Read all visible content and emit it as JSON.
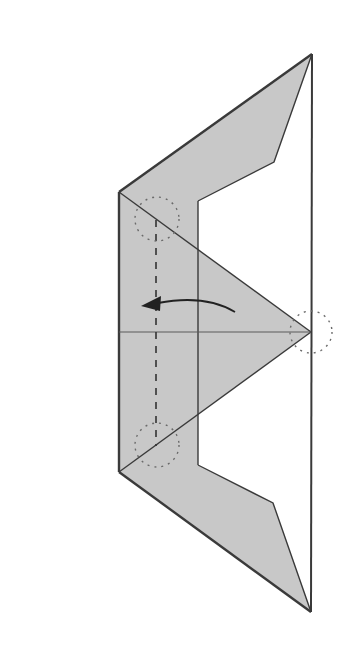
{
  "diagram": {
    "type": "origami-fold-step",
    "colors": {
      "background": "#ffffff",
      "paper_fill": "#c8c8c8",
      "outline": "#3a3a3a",
      "crease": "#5a5a5a",
      "dotted_circle": "#6a6a6a",
      "arrow": "#222222"
    },
    "annotations": {
      "fold_arrow": "valley-fold-arrow-left",
      "fold_line": "dashed-valley-fold-line",
      "reference_points": [
        "top-left-corner-circle",
        "bottom-left-corner-circle",
        "right-tip-circle"
      ]
    }
  }
}
